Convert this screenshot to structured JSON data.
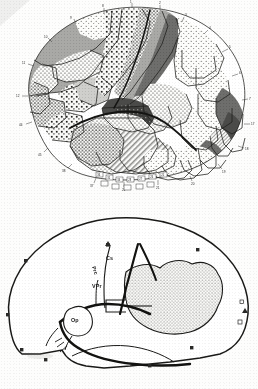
{
  "plate": {
    "title": "Cytoarchitectonic map of the human cerebral hemisphere (lateral view)",
    "background_color": "#fdfdfc",
    "ink_color": "#1a1a1a",
    "figure_count": 2
  },
  "figures": [
    {
      "id": "upper",
      "caption": "",
      "description": "Detailed cytoarchitectonic parcellation of the lateral surface, regions distinguished by stipple, hatch and flat-gray shading",
      "view": "lateral",
      "fill_tones": {
        "white": "#ffffff",
        "light_stipple": "#f2f2f0",
        "medium_gray": "#a8a8a6",
        "dark_gray": "#6f6f6d",
        "darkest_gray": "#4a4a48",
        "hatch_gray": "#bdbdba"
      },
      "boundary_numbers": [
        "1",
        "2",
        "3",
        "4",
        "5",
        "6",
        "7",
        "8",
        "9",
        "10",
        "11",
        "12",
        "17",
        "18",
        "19",
        "20",
        "21",
        "22",
        "37",
        "38",
        "39",
        "40",
        "41",
        "42",
        "43",
        "44",
        "45",
        "46",
        "47",
        "52"
      ],
      "inset_box_numbers": [
        "36",
        "35",
        "34",
        "28",
        "27",
        "26",
        "25"
      ]
    },
    {
      "id": "lower",
      "caption": "",
      "description": "Schematic outline of the same hemisphere showing principal sulci and the stippled occipital field",
      "view": "lateral",
      "stipple_region_label": "",
      "sulcus_labels": [
        {
          "name": "precentral-sulcus",
          "text": "Prc",
          "orientation": "vertical"
        },
        {
          "name": "central-sulcus",
          "text": "Cs",
          "orientation": "horizontal"
        },
        {
          "name": "ventral-precentral",
          "text": "VPr",
          "orientation": "horizontal"
        },
        {
          "name": "operculum",
          "text": "Op",
          "orientation": "horizontal"
        }
      ],
      "marker_types": [
        "filled-square",
        "open-square",
        "triangle"
      ]
    }
  ],
  "legend": {
    "visible": false,
    "items": []
  }
}
